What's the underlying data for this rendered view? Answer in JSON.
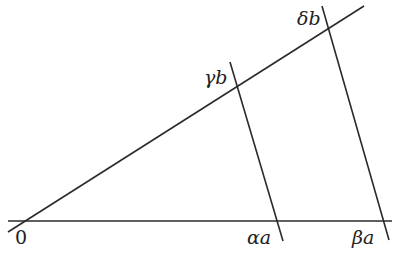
{
  "diagram": {
    "type": "geometric-construction",
    "colors": {
      "stroke": "#2a2a2a",
      "text": "#222222",
      "background": "#ffffff"
    },
    "labels": {
      "origin": "0",
      "alpha_a": "αa",
      "beta_a": "βa",
      "gamma_b": "γb",
      "delta_b": "δb"
    },
    "lines": {
      "horizontal_ray": {
        "x1": 8,
        "y1": 221,
        "x2": 392,
        "y2": 221
      },
      "diagonal_ray": {
        "x1": 8,
        "y1": 232,
        "x2": 364,
        "y2": 6
      },
      "transversal_1": {
        "x1": 230,
        "y1": 62,
        "x2": 283,
        "y2": 241
      },
      "transversal_2": {
        "x1": 322,
        "y1": 6,
        "x2": 389,
        "y2": 240
      }
    }
  }
}
